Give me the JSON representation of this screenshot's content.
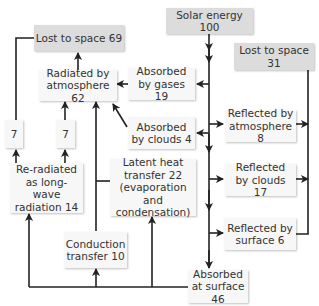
{
  "diagram": {
    "type": "energy-budget-flow",
    "nodes": {
      "solar_energy": "Solar energy 100",
      "lost_to_space_31": "Lost to space 31",
      "lost_to_space_69": "Lost to space 69",
      "radiated_by_atmosphere": "Radiated by atmosphere 62",
      "absorbed_by_gases": "Absorbed by gases 19",
      "absorbed_by_clouds": "Absorbed by clouds 4",
      "reflected_by_atmosphere": "Reflected by atmosphere 8",
      "reflected_by_clouds": "Reflected by clouds 17",
      "reflected_by_surface": "Reflected by surface 6",
      "seven_left": "7",
      "seven_right": "7",
      "re_radiated": "Re-radiated as long-wave radiation 14",
      "latent_heat": "Latent heat transfer 22 (evaporation and condensation)",
      "conduction": "Conduction transfer 10",
      "absorbed_at_surface": "Absorbed at surface 46"
    },
    "colors": {
      "gray_box": "#dcdcdc",
      "white_box": "#f7f7f7",
      "line": "#222222"
    }
  }
}
